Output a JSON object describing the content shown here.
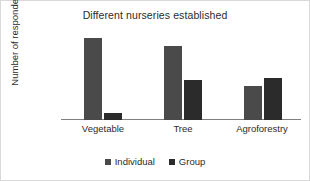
{
  "chart_data": {
    "type": "bar",
    "title": "Different nurseries established",
    "xlabel": "",
    "ylabel": "Number of respondents",
    "categories": [
      "Vegetable",
      "Tree",
      "Agroforestry"
    ],
    "series": [
      {
        "name": "Individual",
        "values": [
          55,
          50,
          23
        ],
        "color": "#4a4a4a"
      },
      {
        "name": "Group",
        "values": [
          5,
          27,
          28
        ],
        "color": "#2b2b2b"
      }
    ],
    "ylim": [
      0,
      60
    ],
    "yticks": [
      0,
      20,
      40,
      60
    ],
    "ytick_labels": [
      "0",
      "20",
      "40",
      "60"
    ],
    "grid": false,
    "legend_position": "bottom"
  }
}
